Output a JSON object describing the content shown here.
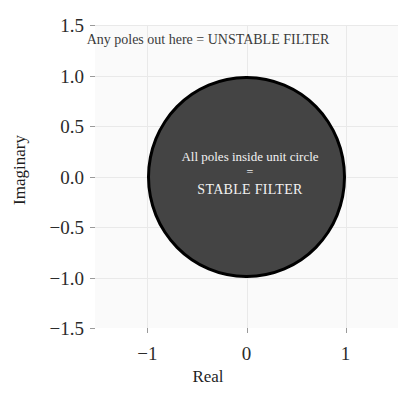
{
  "chart_data": {
    "type": "scatter",
    "title": "",
    "xlabel": "Real",
    "ylabel": "Imaginary",
    "xlim": [
      -1.53,
      1.53
    ],
    "ylim": [
      -1.5,
      1.5
    ],
    "xticks": [
      "-1",
      "0",
      "1"
    ],
    "xtick_values": [
      -1,
      0,
      1
    ],
    "yticks": [
      "1.5",
      "1.0",
      "0.5",
      "0.0",
      "-0.5",
      "-1.0",
      "-1.5"
    ],
    "ytick_values": [
      1.5,
      1.0,
      0.5,
      0.0,
      -0.5,
      -1.0,
      -1.5
    ],
    "grid": true,
    "legend": "none",
    "series": [],
    "shapes": [
      {
        "name": "unit-circle",
        "type": "circle",
        "center_x": 0,
        "center_y": 0,
        "radius": 1,
        "fill": "#444444",
        "stroke": "#000000",
        "stroke_width": 3.5
      }
    ],
    "annotations": [
      {
        "name": "unstable-region-note",
        "text": "Any poles out here = UNSTABLE FILTER",
        "x": 0,
        "y": 1.28,
        "color": "#3a3a3a"
      },
      {
        "name": "stable-region-note",
        "text": "All poles inside unit circle = STABLE FILTER",
        "lines": [
          "All poles inside unit circle",
          "=",
          "STABLE FILTER"
        ],
        "x": 0,
        "y": -0.05,
        "color": "#f2f2f2"
      }
    ]
  },
  "figure": {
    "background": "#ffffff",
    "axes_background": "#fafafa",
    "gridline_color": "#e9e9e9",
    "tick_color": "#9a9a9a",
    "text_color": "#1f1f1f"
  },
  "axis": {
    "x_title": "Real",
    "y_title": "Imaginary"
  },
  "annotations": {
    "unstable": "Any poles out here = UNSTABLE FILTER",
    "stable_line1": "All poles inside unit circle",
    "stable_line2": "=",
    "stable_line3": "STABLE FILTER"
  }
}
